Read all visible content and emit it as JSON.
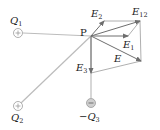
{
  "diagram": {
    "point": {
      "label": "P",
      "x": 91,
      "y": 36
    },
    "charges": [
      {
        "id": "Q1",
        "label": "Q",
        "sub": "1",
        "sign": "+",
        "x": 18,
        "y": 33,
        "label_x": 11,
        "label_y": 24
      },
      {
        "id": "Q2",
        "label": "Q",
        "sub": "2",
        "sign": "+",
        "x": 18,
        "y": 106,
        "label_x": 13,
        "label_y": 122
      },
      {
        "id": "Q3",
        "label": "−Q",
        "sub": "3",
        "sign": "−",
        "x": 91,
        "y": 103,
        "label_x": 80,
        "label_y": 121
      }
    ],
    "vectors": [
      {
        "id": "E1",
        "label": "E",
        "sub": "1",
        "tip_x": 128,
        "tip_y": 36,
        "label_x": 123,
        "label_y": 48
      },
      {
        "id": "E2",
        "label": "E",
        "sub": "2",
        "tip_x": 104,
        "tip_y": 21,
        "label_x": 91,
        "label_y": 17
      },
      {
        "id": "E12",
        "label": "E",
        "sub": "12",
        "tip_x": 140,
        "tip_y": 21,
        "label_x": 133,
        "label_y": 15
      },
      {
        "id": "E",
        "label": "E",
        "sub": "",
        "tip_x": 141,
        "tip_y": 61,
        "label_x": 114,
        "label_y": 62
      },
      {
        "id": "E3",
        "label": "E",
        "sub": "3",
        "tip_x": 91,
        "tip_y": 73,
        "label_x": 76,
        "label_y": 72
      }
    ],
    "colors": {
      "lines": "#b8b8b8",
      "vectors": "#6e6e6e",
      "text": "#222222",
      "charge_fill": "#d0d0d0"
    }
  }
}
